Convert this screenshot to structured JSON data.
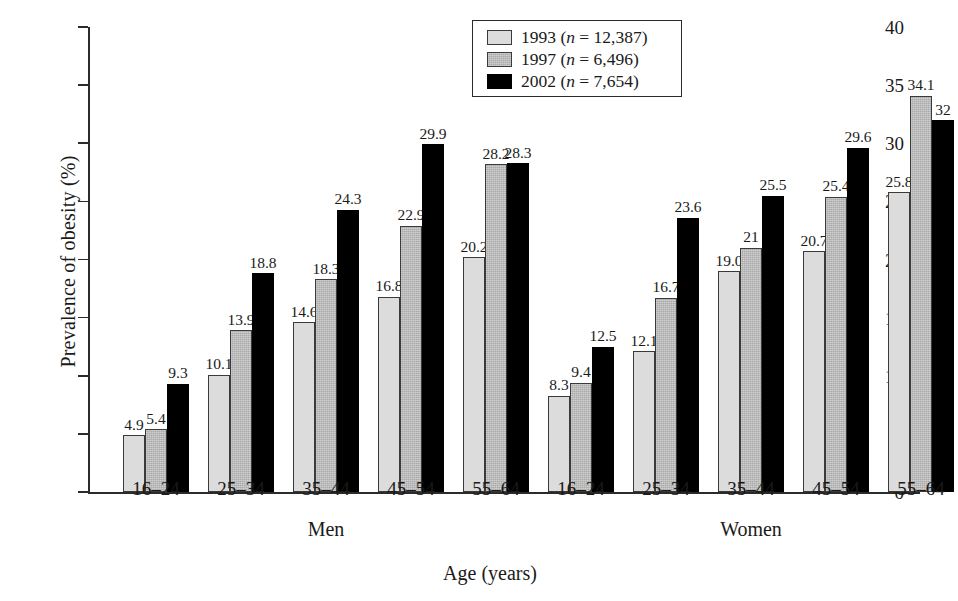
{
  "chart_data": {
    "type": "bar",
    "title": "",
    "xlabel": "Age (years)",
    "ylabel": "Prevalence of obesity (%)",
    "ylim": [
      0,
      40
    ],
    "ytick_step": 5,
    "yticks": [
      0,
      5,
      10,
      15,
      20,
      25,
      30,
      35,
      40
    ],
    "grid": false,
    "legend_position": "top-center",
    "categories": [
      "16–24",
      "25–34",
      "35–44",
      "45–54",
      "55–64"
    ],
    "groups": [
      "Men",
      "Women"
    ],
    "series": [
      {
        "name": "1993",
        "n": "12,387",
        "legend_label": "1993 (n = 12,387)",
        "color": "#dcdcdc",
        "values": {
          "Men": [
            4.9,
            10.1,
            14.6,
            16.8,
            20.2
          ],
          "Women": [
            8.3,
            12.1,
            19.0,
            20.7,
            25.8
          ]
        },
        "labels": {
          "Men": [
            "4.9",
            "10.1",
            "14.6",
            "16.8",
            "20.2"
          ],
          "Women": [
            "8.3",
            "12.1",
            "19.0",
            "20.7",
            "25.8"
          ]
        }
      },
      {
        "name": "1997",
        "n": "6,496",
        "legend_label": "1997 (n = 6,496)",
        "color": "#a9a9a9",
        "values": {
          "Men": [
            5.4,
            13.9,
            18.3,
            22.9,
            28.2
          ],
          "Women": [
            9.4,
            16.7,
            21.0,
            25.4,
            34.1
          ]
        },
        "labels": {
          "Men": [
            "5.4",
            "13.9",
            "18.3",
            "22.9",
            "28.2"
          ],
          "Women": [
            "9.4",
            "16.7",
            "21",
            "25.4",
            "34.1"
          ]
        }
      },
      {
        "name": "2002",
        "n": "7,654",
        "legend_label": "2002 (n = 7,654)",
        "color": "#000000",
        "values": {
          "Men": [
            9.3,
            18.8,
            24.3,
            29.9,
            28.3
          ],
          "Women": [
            12.5,
            23.6,
            25.5,
            29.6,
            32.0
          ]
        },
        "labels": {
          "Men": [
            "9.3",
            "18.8",
            "24.3",
            "29.9",
            "28.3"
          ],
          "Women": [
            "12.5",
            "23.6",
            "25.5",
            "29.6",
            "32"
          ]
        }
      }
    ],
    "legend": [
      {
        "year": "1993",
        "n_prefix": "(",
        "n_var": "n",
        "n_eq": " = ",
        "n_value": "12,387)"
      },
      {
        "year": "1997",
        "n_prefix": "(",
        "n_var": "n",
        "n_eq": " = ",
        "n_value": "6,496)"
      },
      {
        "year": "2002",
        "n_prefix": "(",
        "n_var": "n",
        "n_eq": " = ",
        "n_value": "7,654)"
      }
    ]
  }
}
